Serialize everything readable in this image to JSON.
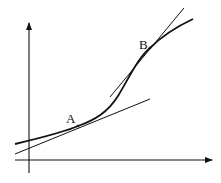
{
  "diagram": {
    "axes": {
      "x_axis": {
        "from": [
          15,
          160
        ],
        "to": [
          213,
          160
        ],
        "arrow": true
      },
      "y_axis": {
        "from": [
          29,
          173
        ],
        "to": [
          29,
          22
        ],
        "arrow": true
      }
    },
    "curve": {
      "path": "M 15 144 C 40 138, 65 132, 78 126 C 95 120, 108 112, 118 96 C 130 76, 138 58, 150 48 C 162 36, 178 26, 193 19"
    },
    "points": [
      {
        "label": "A",
        "x": 78,
        "y": 126,
        "label_x": 69,
        "label_y": 123
      },
      {
        "label": "B",
        "x": 150,
        "y": 48,
        "label_x": 138,
        "label_y": 48
      }
    ],
    "tangents": [
      {
        "at": "A",
        "from": [
          15,
          154
        ],
        "to": [
          150,
          99
        ]
      },
      {
        "at": "B",
        "from": [
          110,
          97
        ],
        "to": [
          184,
          8
        ]
      }
    ],
    "colors": {
      "stroke": "#111111",
      "background": "#ffffff"
    }
  }
}
